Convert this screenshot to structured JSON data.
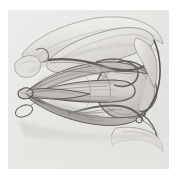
{
  "figure": {
    "kind": "anatomical-illustration",
    "medium": "halftone pencil / engraving, grayscale",
    "caption": "",
    "labels": [],
    "annotations": [],
    "plate": {
      "x": 8,
      "y": 10,
      "width": 161,
      "height": 159
    },
    "canvas": {
      "width": 177,
      "height": 179,
      "background": "#ffffff"
    },
    "palette": {
      "page": "#ffffff",
      "plate_base": "#e7e6e4",
      "paper_tint": "#eceae8",
      "bone_light": "#f2f1ef",
      "bone_mid": "#d9d7d3",
      "bone_shadow": "#bfbcb7",
      "muscle_light": "#cfccc6",
      "muscle_mid": "#b3afa8",
      "muscle_dark": "#8e8a83",
      "globe_fill": "#c8c5bf",
      "globe_highlight": "#dedbd5",
      "ink_line": "#4a4742",
      "ink_dark": "#33312d",
      "ink_soft": "#6e6b65",
      "vessel": "#5b5853"
    },
    "structures": [
      {
        "name": "frontal-bone-roof",
        "region": "upper-left-to-upper-right band"
      },
      {
        "name": "levator-palpebrae-superioris",
        "region": "upper muscle band"
      },
      {
        "name": "superior-rectus",
        "region": "upper cone muscle"
      },
      {
        "name": "superior-oblique",
        "region": "arching tendon over globe"
      },
      {
        "name": "lateral-rectus",
        "region": "central long muscle belly"
      },
      {
        "name": "inferior-rectus",
        "region": "lower cone muscle"
      },
      {
        "name": "inferior-oblique",
        "region": "lower anterior oblique band"
      },
      {
        "name": "optic-nerve",
        "region": "apex converging bundle"
      },
      {
        "name": "annulus-of-zinn",
        "region": "orbital apex convergence point"
      },
      {
        "name": "globe-eyeball",
        "region": "right circular body"
      },
      {
        "name": "cornea-anterior-chamber",
        "region": "right edge of globe"
      },
      {
        "name": "upper-eyelid-margin",
        "region": "right curved dark line"
      },
      {
        "name": "lower-eyelid-margin",
        "region": "lower right curve"
      },
      {
        "name": "maxilla-orbital-floor",
        "region": "lower right bone"
      },
      {
        "name": "optic-canal-loop",
        "region": "small oval at left outside apex"
      },
      {
        "name": "ciliary-vessels",
        "region": "thin dark filaments over cone"
      }
    ]
  }
}
